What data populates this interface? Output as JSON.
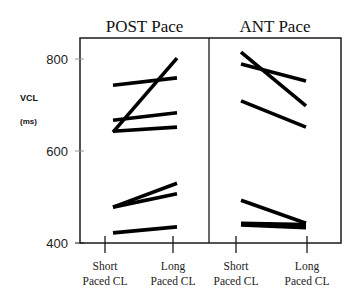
{
  "chart_data": {
    "type": "line",
    "title": "",
    "ylabel": "VCL",
    "ylabel_unit": "(ms)",
    "xlabel": "",
    "ylim": [
      400,
      850
    ],
    "yticks": [
      400,
      600,
      800
    ],
    "x_categories": [
      {
        "line1": "Short",
        "line2": "Paced CL"
      },
      {
        "line1": "Long",
        "line2": "Paced CL"
      }
    ],
    "grid": false,
    "legend": null,
    "panels": [
      {
        "title": "POST Pace",
        "series": [
          {
            "name": "POST-1",
            "values": [
              743,
              759
            ]
          },
          {
            "name": "POST-2",
            "values": [
              641,
              802
            ]
          },
          {
            "name": "POST-3",
            "values": [
              667,
              683
            ]
          },
          {
            "name": "POST-4",
            "values": [
              643,
              652
            ]
          },
          {
            "name": "POST-5",
            "values": [
              478,
              530
            ]
          },
          {
            "name": "POST-6",
            "values": [
              478,
              507
            ]
          },
          {
            "name": "POST-7",
            "values": [
              422,
              435
            ]
          }
        ]
      },
      {
        "title": "ANT Pace",
        "series": [
          {
            "name": "ANT-1",
            "values": [
              815,
              698
            ]
          },
          {
            "name": "ANT-2",
            "values": [
              789,
              752
            ]
          },
          {
            "name": "ANT-3",
            "values": [
              709,
              652
            ]
          },
          {
            "name": "ANT-4",
            "values": [
              493,
              443
            ]
          },
          {
            "name": "ANT-5",
            "values": [
              443,
              440
            ]
          },
          {
            "name": "ANT-6",
            "values": [
              439,
              433
            ]
          }
        ]
      }
    ]
  },
  "colors": {
    "line": "#000000",
    "axis": "#1a1a1a",
    "tick_gray": "#999999",
    "background": "#ffffff"
  }
}
